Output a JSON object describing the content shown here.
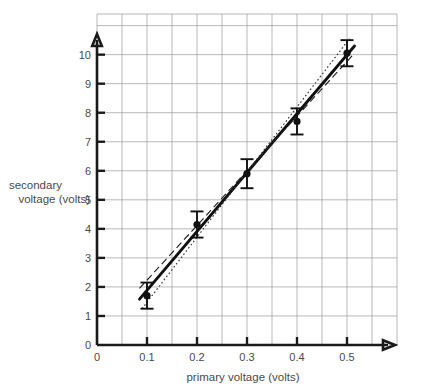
{
  "chart_data": {
    "type": "scatter",
    "title": "",
    "xlabel": "primary voltage (volts)",
    "ylabel": "secondary voltage (volts)",
    "ylabel_line1": "secondary",
    "ylabel_line2": "voltage (volts)",
    "xlim": [
      0,
      0.6
    ],
    "ylim": [
      0,
      11.4
    ],
    "grid": true,
    "legend": "none",
    "xticks": [
      0,
      0.1,
      0.2,
      0.3,
      0.4,
      0.5
    ],
    "xticklabels": [
      "0",
      "0.1",
      "0.2",
      "0.3",
      "0.4",
      "0.5"
    ],
    "yticks": [
      0,
      1,
      2,
      3,
      4,
      5,
      6,
      7,
      8,
      9,
      10
    ],
    "yticklabels": [
      "0",
      "1",
      "2",
      "3",
      "4",
      "5",
      "6",
      "7",
      "8",
      "9",
      "10"
    ],
    "x": [
      0.1,
      0.2,
      0.3,
      0.4,
      0.5
    ],
    "y": [
      1.7,
      4.15,
      5.9,
      7.7,
      10.05
    ],
    "yerr": [
      0.45,
      0.45,
      0.5,
      0.45,
      0.45
    ],
    "series": [
      {
        "name": "measured points",
        "style": "marker-with-error-bars",
        "x": [
          0.1,
          0.2,
          0.3,
          0.4,
          0.5
        ],
        "values": [
          1.7,
          4.15,
          5.9,
          7.7,
          10.05
        ],
        "yerr": [
          0.45,
          0.45,
          0.5,
          0.45,
          0.45
        ]
      },
      {
        "name": "best fit line",
        "style": "solid",
        "x": [
          0.085,
          0.515
        ],
        "values": [
          1.58,
          10.3
        ]
      },
      {
        "name": "minimum gradient line",
        "style": "dashed",
        "x": [
          0.085,
          0.515
        ],
        "values": [
          1.95,
          10.05
        ]
      },
      {
        "name": "maximum gradient line",
        "style": "dotted",
        "x": [
          0.09,
          0.505
        ],
        "values": [
          1.25,
          10.55
        ]
      }
    ]
  },
  "colors": {
    "grid": "#9a9a9a",
    "axis": "#1a1a1a",
    "data": "#111111",
    "text": "#4a4a4a",
    "background": "#ffffff"
  }
}
